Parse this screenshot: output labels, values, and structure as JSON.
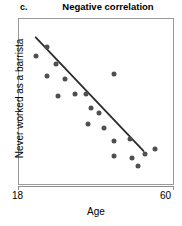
{
  "panel": {
    "letter": "c.",
    "title": "Negative correlation"
  },
  "axes": {
    "x_label": "Age",
    "y_label": "Never worked as a barrista",
    "x_min_label": "18",
    "x_max_label": "60"
  },
  "colors": {
    "point": "#4f4f4f",
    "line": "#2b2b2b",
    "frame": "#9a9a9a"
  },
  "chart_data": {
    "type": "scatter",
    "title": "Negative correlation",
    "xlabel": "Age",
    "ylabel": "Never worked as a barrista",
    "xlim": [
      18,
      60
    ],
    "ylim": [
      0,
      100
    ],
    "grid": false,
    "legend": null,
    "x_ticks": [
      18,
      60
    ],
    "y_ticks": [],
    "points": [
      {
        "x": 22.5,
        "y": 78
      },
      {
        "x": 25.5,
        "y": 83
      },
      {
        "x": 28.0,
        "y": 73
      },
      {
        "x": 25.5,
        "y": 66
      },
      {
        "x": 30.5,
        "y": 64
      },
      {
        "x": 28.5,
        "y": 54
      },
      {
        "x": 33.0,
        "y": 55
      },
      {
        "x": 36.0,
        "y": 55
      },
      {
        "x": 43.5,
        "y": 67
      },
      {
        "x": 37.5,
        "y": 47
      },
      {
        "x": 39.5,
        "y": 44
      },
      {
        "x": 36.5,
        "y": 37
      },
      {
        "x": 41.0,
        "y": 35
      },
      {
        "x": 43.5,
        "y": 27
      },
      {
        "x": 48.0,
        "y": 28
      },
      {
        "x": 43.5,
        "y": 18
      },
      {
        "x": 48.5,
        "y": 17
      },
      {
        "x": 52.0,
        "y": 19
      },
      {
        "x": 50.0,
        "y": 12
      },
      {
        "x": 54.5,
        "y": 22
      }
    ],
    "trend_line": {
      "label": "fitted negative trend",
      "x0": 22.5,
      "y0": 89,
      "x1": 51.5,
      "y1": 21
    }
  }
}
